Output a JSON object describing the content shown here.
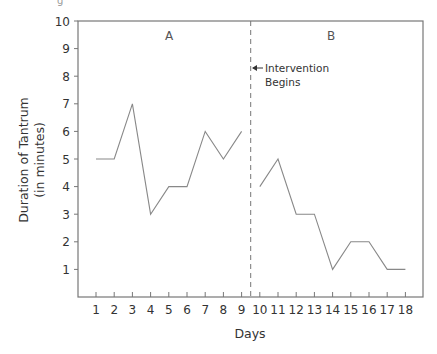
{
  "top_fragment": "g",
  "chart_data": {
    "type": "line",
    "title": "",
    "xlabel": "Days",
    "ylabel": "Duration of Tantrum",
    "ylabel_sub": "(in minutes)",
    "ylim": [
      0,
      10
    ],
    "xlim": [
      1,
      18
    ],
    "grid": false,
    "y_ticks": [
      1,
      2,
      3,
      4,
      5,
      6,
      7,
      8,
      9,
      10
    ],
    "x_ticks": [
      1,
      2,
      3,
      4,
      5,
      6,
      7,
      8,
      9,
      10,
      11,
      12,
      13,
      14,
      15,
      16,
      17,
      18
    ],
    "phases": [
      {
        "label": "A",
        "days": [
          1,
          9
        ]
      },
      {
        "label": "B",
        "days": [
          10,
          18
        ]
      }
    ],
    "series": [
      {
        "name": "Phase A",
        "x": [
          1,
          2,
          3,
          4,
          5,
          6,
          7,
          8,
          9
        ],
        "values": [
          5,
          5,
          7,
          3,
          4,
          4,
          6,
          5,
          6
        ]
      },
      {
        "name": "Phase B",
        "x": [
          10,
          11,
          12,
          13,
          14,
          15,
          16,
          17,
          18
        ],
        "values": [
          4,
          5,
          3,
          3,
          1,
          2,
          2,
          1,
          1
        ]
      }
    ],
    "annotations": [
      {
        "text": "Intervention",
        "line2": "Begins",
        "at_x": 9.5,
        "type": "arrow-left"
      }
    ],
    "phase_change_line": {
      "at_x": 9.5,
      "style": "dashed"
    }
  }
}
